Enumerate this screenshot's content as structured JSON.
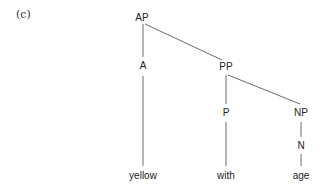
{
  "figure_label": "(c)",
  "tree": {
    "nodes": {
      "AP": "AP",
      "A": "A",
      "PP": "PP",
      "P": "P",
      "NP": "NP",
      "N": "N",
      "yellow": "yellow",
      "with": "with",
      "age": "age"
    },
    "edges": [
      [
        "AP",
        "A"
      ],
      [
        "AP",
        "PP"
      ],
      [
        "A",
        "yellow"
      ],
      [
        "PP",
        "P"
      ],
      [
        "PP",
        "NP"
      ],
      [
        "P",
        "with"
      ],
      [
        "NP",
        "N"
      ],
      [
        "N",
        "age"
      ]
    ]
  }
}
